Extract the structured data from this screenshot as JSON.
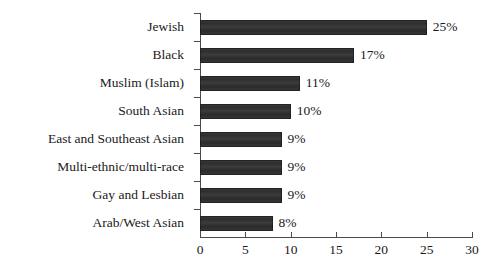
{
  "chart_data": {
    "type": "bar",
    "orientation": "horizontal",
    "title": "",
    "subtitle": "",
    "xlabel": "",
    "ylabel": "",
    "xlim": [
      0,
      30
    ],
    "xticks": [
      0,
      5,
      10,
      15,
      20,
      25,
      30
    ],
    "xtick_labels": [
      "0",
      "5",
      "10",
      "15",
      "20",
      "25",
      "30"
    ],
    "grid": false,
    "legend": false,
    "bar_color": "#333333",
    "axis_color": "#4a4a4a",
    "background": "#ffffff",
    "categories": [
      "Jewish",
      "Black",
      "Muslim (Islam)",
      "South Asian",
      "East and Southeast Asian",
      "Multi-ethnic/multi-race",
      "Gay and Lesbian",
      "Arab/West Asian"
    ],
    "values": [
      25,
      17,
      11,
      10,
      9,
      9,
      9,
      8
    ],
    "value_labels": [
      "25%",
      "17%",
      "11%",
      "10%",
      "9%",
      "9%",
      "9%",
      "8%"
    ]
  }
}
